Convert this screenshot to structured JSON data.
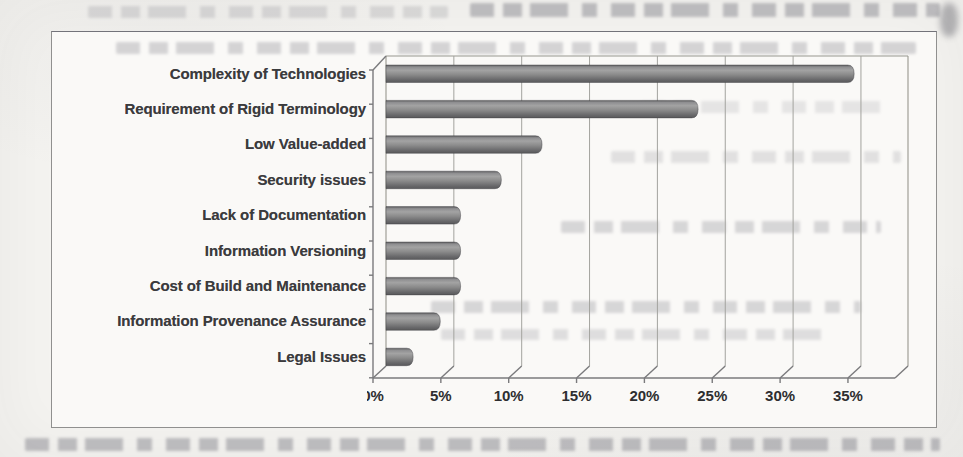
{
  "page": {
    "background_hex": "#f4f3f0",
    "figure_border_hex": "#90908f"
  },
  "chart_data": {
    "type": "bar",
    "orientation": "horizontal",
    "title": "",
    "xlabel": "",
    "ylabel": "",
    "categories": [
      "Complexity of Technologies",
      "Requirement of Rigid Terminology",
      "Low Value-added",
      "Security issues",
      "Lack of Documentation",
      "Information Versioning",
      "Cost of Build and Maintenance",
      "Information Provenance Assurance",
      "Legal Issues"
    ],
    "values": [
      34.5,
      23,
      11.5,
      8.5,
      5.5,
      5.5,
      5.5,
      4,
      2
    ],
    "value_unit": "%",
    "xlim": [
      0,
      35
    ],
    "x_tick_step": 5,
    "x_tick_labels": [
      "0%",
      "5%",
      "10%",
      "15%",
      "20%",
      "25%",
      "30%",
      "35%"
    ],
    "grid": true,
    "legend_position": "none",
    "bar_style": "3d-cylinder",
    "bar_color_hex": "#8a8a8a",
    "gridline_color_hex": "#a3a39e",
    "label_color_hex": "#3b3b3d"
  }
}
